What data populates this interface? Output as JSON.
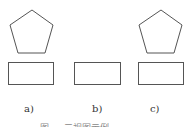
{
  "figure": {
    "stroke_color": "#555555",
    "panels": [
      {
        "label": "a)",
        "shapes": [
          "pentagon",
          "rectangle"
        ]
      },
      {
        "label": "b)",
        "shapes": [
          "rectangle"
        ]
      },
      {
        "label": "c)",
        "shapes": [
          "pentagon",
          "rectangle"
        ]
      }
    ],
    "caption": "图 — 三视图示例"
  }
}
